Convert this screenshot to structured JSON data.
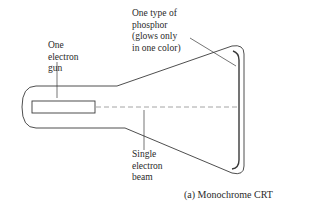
{
  "diagram": {
    "title": "Monochrome CRT",
    "caption": "(a) Monochrome CRT",
    "labels": {
      "gun": "One\nelectron\ngun",
      "phosphor": "One type of\nphosphor\n(glows only\nin one color)",
      "beam": "Single\nelectron\nbeam"
    },
    "components": [
      "electron gun",
      "phosphor screen",
      "electron beam",
      "CRT tube envelope"
    ],
    "colors": {
      "line": "#3a3a3a",
      "beam": "#9a9a9a",
      "text": "#2a2a2a",
      "background": "#ffffff"
    }
  }
}
